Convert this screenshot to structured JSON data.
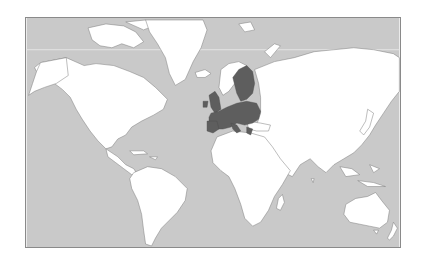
{
  "map": {
    "projection": "mercator",
    "subject": "European Union member states highlighted on world map",
    "colors": {
      "ocean": "#c9c9c9",
      "land": "#ffffff",
      "highlight": "#5e5e5e",
      "border": "#7a7a7a",
      "frame": "#8a8a8a",
      "arctic_circle": "#e4e4e4"
    },
    "regions": [
      {
        "name": "north-america",
        "highlighted": false
      },
      {
        "name": "greenland",
        "highlighted": false
      },
      {
        "name": "south-america",
        "highlighted": false
      },
      {
        "name": "europe-eu",
        "highlighted": true
      },
      {
        "name": "europe-non-eu",
        "highlighted": false
      },
      {
        "name": "africa",
        "highlighted": false
      },
      {
        "name": "asia",
        "highlighted": false
      },
      {
        "name": "australia",
        "highlighted": false
      },
      {
        "name": "new-zealand",
        "highlighted": false
      }
    ]
  }
}
